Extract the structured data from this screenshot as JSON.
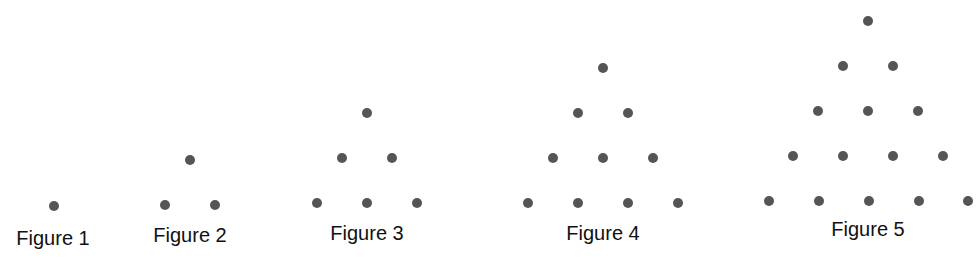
{
  "diagram": {
    "dot_color": "#555555",
    "dot_radius": 5,
    "figures": [
      {
        "label": "Figure 1",
        "label_x": 53,
        "label_y": 245,
        "dots": [
          [
            54,
            206
          ]
        ]
      },
      {
        "label": "Figure 2",
        "label_x": 190,
        "label_y": 242,
        "dots": [
          [
            190,
            160
          ],
          [
            165,
            205
          ],
          [
            215,
            205
          ]
        ]
      },
      {
        "label": "Figure 3",
        "label_x": 367,
        "label_y": 240,
        "dots": [
          [
            367,
            113
          ],
          [
            342,
            158
          ],
          [
            392,
            158
          ],
          [
            317,
            203
          ],
          [
            367,
            203
          ],
          [
            417,
            203
          ]
        ]
      },
      {
        "label": "Figure 4",
        "label_x": 603,
        "label_y": 240,
        "dots": [
          [
            603,
            68
          ],
          [
            578,
            113
          ],
          [
            628,
            113
          ],
          [
            553,
            158
          ],
          [
            603,
            158
          ],
          [
            653,
            158
          ],
          [
            528,
            203
          ],
          [
            578,
            203
          ],
          [
            628,
            203
          ],
          [
            678,
            203
          ]
        ]
      },
      {
        "label": "Figure 5",
        "label_x": 868,
        "label_y": 236,
        "dots": [
          [
            868,
            21
          ],
          [
            843,
            66
          ],
          [
            893,
            66
          ],
          [
            818,
            111
          ],
          [
            868,
            111
          ],
          [
            918,
            111
          ],
          [
            793,
            156
          ],
          [
            843,
            156
          ],
          [
            893,
            156
          ],
          [
            943,
            156
          ],
          [
            769,
            201
          ],
          [
            819,
            201
          ],
          [
            869,
            201
          ],
          [
            919,
            201
          ],
          [
            968,
            201
          ]
        ]
      }
    ]
  }
}
